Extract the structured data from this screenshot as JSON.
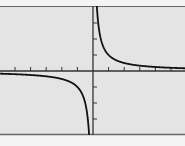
{
  "chart_data": {
    "type": "line",
    "title": "",
    "xlabel": "",
    "ylabel": "",
    "function": "y = 1/x",
    "xlim": [
      -6,
      6
    ],
    "ylim": [
      -4,
      4
    ],
    "x_tick_step": 1,
    "y_tick_step": 1,
    "x_ticks": [
      -5,
      -4,
      -3,
      -2,
      -1,
      1,
      2,
      3,
      4,
      5
    ],
    "y_ticks": [
      -3,
      -2,
      -1,
      1,
      2,
      3
    ],
    "grid": false,
    "legend": "none",
    "series": [
      {
        "name": "branch-right",
        "x": [
          0.25,
          0.3,
          0.5,
          0.75,
          1,
          1.5,
          2,
          3,
          4,
          5,
          6
        ],
        "y": [
          4,
          3.33,
          2,
          1.33,
          1,
          0.67,
          0.5,
          0.33,
          0.25,
          0.2,
          0.17
        ]
      },
      {
        "name": "branch-left",
        "x": [
          -6,
          -5,
          -4,
          -3,
          -2,
          -1.5,
          -1,
          -0.75,
          -0.5,
          -0.3,
          -0.25
        ],
        "y": [
          -0.17,
          -0.2,
          -0.25,
          -0.33,
          -0.5,
          -0.67,
          -1,
          -1.33,
          -2,
          -3.33,
          -4
        ]
      }
    ]
  },
  "colors": {
    "background": "#e4e4e4",
    "frame": "#6a6a6a",
    "axis": "#333333",
    "curve": "#111111",
    "page": "#f4f4f4"
  },
  "layout": {
    "origin_px": [
      93,
      71
    ],
    "x_px_per_unit": 15.6,
    "y_px_per_unit": 16,
    "frame_top": 6,
    "frame_bottom": 135
  }
}
